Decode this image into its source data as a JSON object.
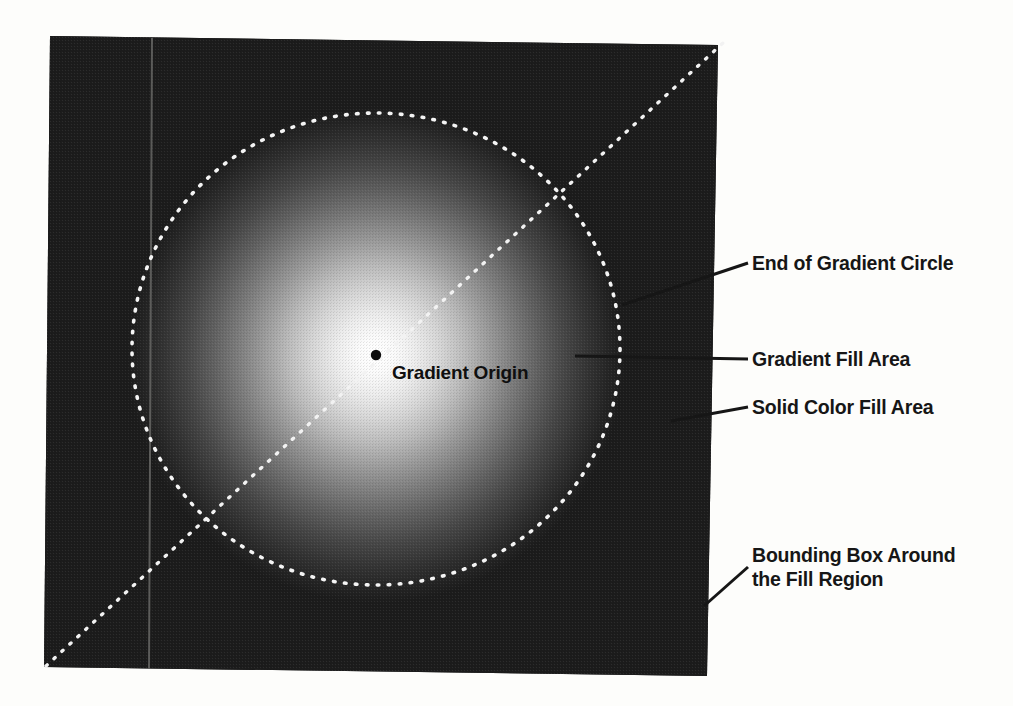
{
  "figure": {
    "background_color": "#fdfdfb",
    "ink_color": "#161616"
  },
  "fill_region": {
    "name": "bounding-box",
    "description": "Skewed rectangular bounding box containing the radial gradient",
    "corners": {
      "top_left": [
        50,
        36
      ],
      "top_right": [
        718,
        45
      ],
      "bottom_right": [
        707,
        676
      ],
      "bottom_left": [
        44,
        667
      ]
    },
    "solid_color": "#1c1c1c"
  },
  "gradient": {
    "type": "radial",
    "origin": [
      376,
      355
    ],
    "end_circle_radius": 244,
    "center_color": "#ffffff",
    "edge_color": "#1c1c1c",
    "origin_marker": {
      "name": "gradient-origin-dot",
      "radius_px": 5,
      "color": "#101010"
    }
  },
  "end_circle": {
    "name": "end-of-gradient-circle",
    "center": [
      376,
      349
    ],
    "radius_x": 244,
    "radius_y": 236,
    "stroke": "#ffffff",
    "style": "dotted"
  },
  "radius_line": {
    "name": "gradient-radius-diagonal",
    "from": [
      46,
      666
    ],
    "to": [
      722,
      44
    ],
    "stroke": "#ffffff",
    "style": "dotted"
  },
  "guide_line": {
    "name": "vertical-guide-line",
    "from": [
      152,
      38
    ],
    "to": [
      149,
      670
    ],
    "stroke": "#6a6a6a"
  },
  "callouts": [
    {
      "id": "end-of-gradient-circle",
      "label": "End of Gradient Circle",
      "leader_from": [
        622,
        305
      ],
      "leader_to": [
        748,
        263
      ],
      "text_anchor": [
        752,
        251
      ]
    },
    {
      "id": "gradient-fill-area",
      "label": "Gradient Fill Area",
      "leader_from": [
        575,
        356
      ],
      "leader_to": [
        748,
        359
      ],
      "text_anchor": [
        752,
        347
      ]
    },
    {
      "id": "solid-color-fill-area",
      "label": "Solid Color Fill Area",
      "leader_from": [
        671,
        421
      ],
      "leader_to": [
        748,
        407
      ],
      "text_anchor": [
        752,
        395
      ]
    },
    {
      "id": "bounding-box-around-the-fill-region",
      "label": "Bounding Box Around\nthe Fill Region",
      "leader_from": [
        704,
        606
      ],
      "leader_to": [
        748,
        567
      ],
      "text_anchor": [
        752,
        543
      ]
    }
  ],
  "origin_label": {
    "id": "gradient-origin",
    "label": "Gradient Origin",
    "text_anchor": [
      392,
      362
    ]
  }
}
